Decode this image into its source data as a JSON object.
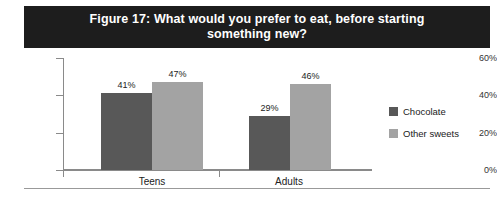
{
  "title": {
    "line1": "Figure 17: What would you prefer to eat, before starting",
    "line2": "something new?"
  },
  "legend": {
    "items": [
      {
        "label": "Chocolate",
        "color": "#585858"
      },
      {
        "label": "Other sweets",
        "color": "#a3a3a3"
      }
    ]
  },
  "footer": {
    "note": ""
  },
  "chart_data": {
    "type": "bar",
    "title": "Figure 17: What would you prefer to eat, before starting something new?",
    "categories": [
      "Teens",
      "Adults"
    ],
    "series": [
      {
        "name": "Chocolate",
        "color": "#585858",
        "values": [
          41,
          29
        ],
        "labels": [
          "41%",
          "29%"
        ]
      },
      {
        "name": "Other sweets",
        "color": "#a3a3a3",
        "values": [
          47,
          46
        ],
        "labels": [
          "47%",
          "46%"
        ]
      }
    ],
    "xlabel": "",
    "ylabel": "",
    "ylim": [
      0,
      60
    ],
    "yticks": [
      0,
      20,
      40,
      60
    ],
    "ytick_labels": [
      "0%",
      "20%",
      "40%",
      "60%"
    ],
    "grid": false,
    "legend_position": "right"
  }
}
